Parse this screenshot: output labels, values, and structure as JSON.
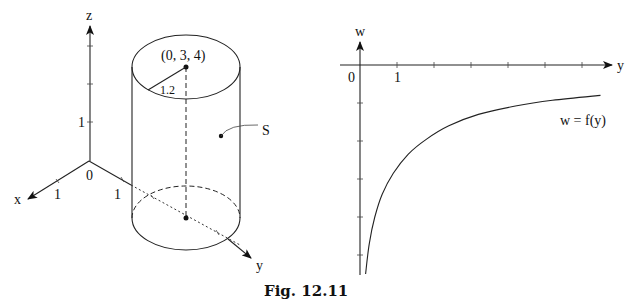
{
  "figure": {
    "caption": "Fig. 12.11"
  },
  "left_panel": {
    "axes": {
      "z_label": "z",
      "x_label": "x",
      "y_label": "y",
      "origin_label": "0",
      "z_tick_label": "1",
      "x_tick_label": "1",
      "y_tick_label": "1"
    },
    "cylinder": {
      "center_label": "(0, 3, 4)",
      "radius_label": "1.2",
      "surface_label": "S"
    }
  },
  "right_panel": {
    "axes": {
      "vertical_label": "w",
      "horizontal_label": "y",
      "origin_label": "0",
      "tick_label_1": "1"
    },
    "curve_label": "w = f(y)"
  },
  "chart_data": {
    "type": "line",
    "title": "",
    "xlabel": "y",
    "ylabel": "w",
    "x_ticks": [
      1,
      2,
      3,
      4,
      5,
      6
    ],
    "x_tick_labels": [
      "1",
      "",
      "",
      "",
      "",
      ""
    ],
    "y_ticks": [
      -1,
      -2,
      -3,
      -4,
      -5
    ],
    "y_tick_labels": [
      "",
      "",
      "",
      "",
      ""
    ],
    "xlim": [
      0,
      6.7
    ],
    "ylim": [
      -5.5,
      0
    ],
    "grid": false,
    "series": [
      {
        "name": "w = f(y)",
        "x": [
          0.15,
          0.25,
          0.4,
          0.6,
          0.9,
          1.3,
          1.8,
          2.4,
          3.2,
          4.2,
          5.2,
          6.5
        ],
        "y": [
          -5.5,
          -4.7,
          -4.0,
          -3.4,
          -2.85,
          -2.35,
          -1.95,
          -1.6,
          -1.3,
          -1.08,
          -0.93,
          -0.8
        ]
      }
    ],
    "legend": "none",
    "annotations": [
      "w = f(y)"
    ]
  }
}
